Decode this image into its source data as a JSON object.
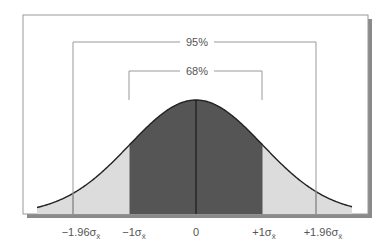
{
  "diagram": {
    "brackets": [
      {
        "label": "95%",
        "from": "-1.96",
        "to": "+1.96"
      },
      {
        "label": "68%",
        "from": "-1",
        "to": "+1"
      }
    ],
    "axis_labels": [
      {
        "id": "m196",
        "prefix": "−1.96σ",
        "sub": "x̄",
        "z": -1.96
      },
      {
        "id": "m1",
        "prefix": "−1σ",
        "sub": "x̄",
        "z": -1
      },
      {
        "id": "zero",
        "prefix": "0",
        "sub": "",
        "z": 0
      },
      {
        "id": "p1",
        "prefix": "+1σ",
        "sub": "x̄",
        "z": 1
      },
      {
        "id": "p196",
        "prefix": "+1.96σ",
        "sub": "x̄",
        "z": 1.96
      }
    ],
    "colors": {
      "inner_fill": "#555555",
      "outer_fill": "#dcdcdc",
      "curve": "#222222",
      "frame": "#999999",
      "shadow": "#8a8a8a"
    }
  }
}
